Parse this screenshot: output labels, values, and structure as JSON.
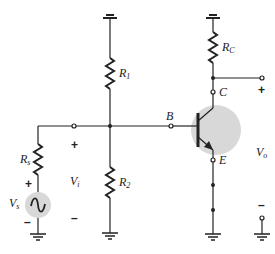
{
  "diagram": {
    "colors": {
      "wire": "#222222",
      "highlight": "#d8d8d8"
    },
    "components": {
      "R1": {
        "label": "R",
        "sub": "1"
      },
      "R2": {
        "label": "R",
        "sub": "2"
      },
      "RC": {
        "label": "R",
        "sub": "C"
      },
      "Rs": {
        "label": "R",
        "sub": "s"
      },
      "Vs": {
        "label": "V",
        "sub": "s",
        "type": "ac-source"
      },
      "transistor": {
        "type": "npn-bjt"
      }
    },
    "terminals": {
      "B": "B",
      "C": "C",
      "E": "E"
    },
    "voltages": {
      "Vi": {
        "label": "V",
        "sub": "i",
        "plus": "+",
        "minus": "–"
      },
      "Vo": {
        "label": "V",
        "sub": "o",
        "plus": "+",
        "minus": "–"
      },
      "Vs_plus": "+",
      "Vs_minus": "–"
    }
  }
}
